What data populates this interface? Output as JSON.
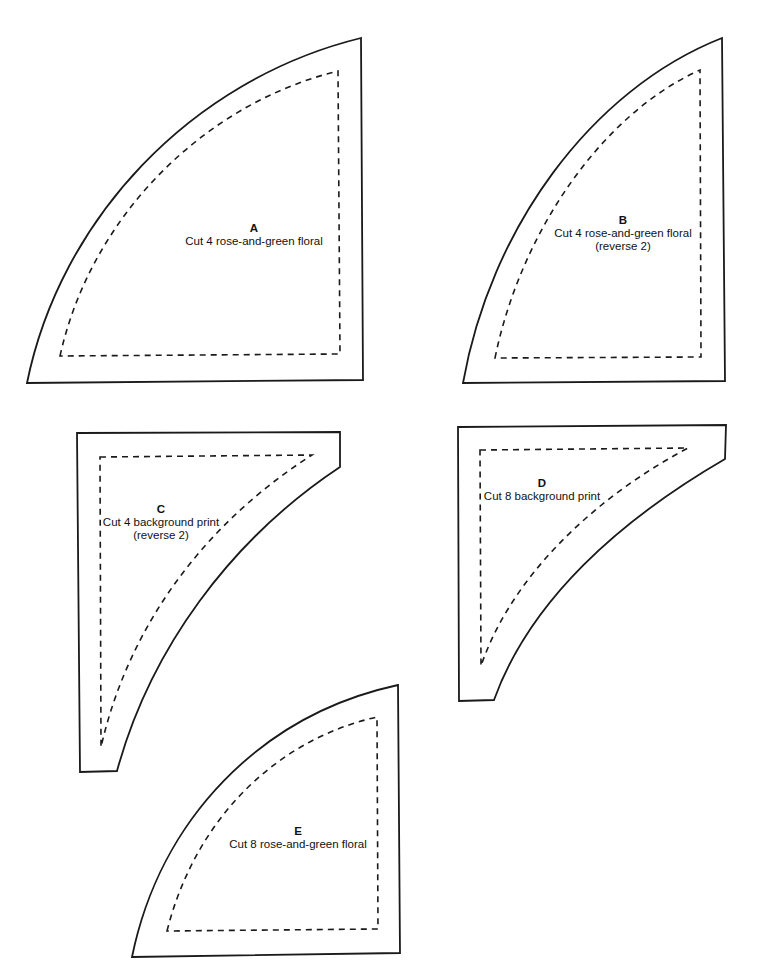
{
  "pattern": {
    "colors": {
      "background": "#ffffff",
      "stroke": "#1a1a1a"
    },
    "legend": {
      "solid_line": "cutting line",
      "dashed_line": "seam line"
    },
    "pieces": [
      {
        "letter": "A",
        "instruction": "Cut 4 rose-and-green floral",
        "note": ""
      },
      {
        "letter": "B",
        "instruction": "Cut 4 rose-and-green floral",
        "note": "(reverse 2)"
      },
      {
        "letter": "C",
        "instruction": "Cut 4 background print",
        "note": "(reverse 2)"
      },
      {
        "letter": "D",
        "instruction": "Cut 8 background print",
        "note": ""
      },
      {
        "letter": "E",
        "instruction": "Cut 8 rose-and-green floral",
        "note": ""
      }
    ]
  }
}
